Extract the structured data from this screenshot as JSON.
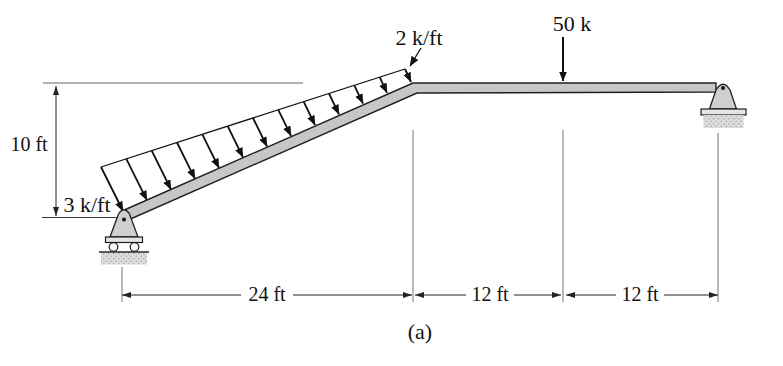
{
  "diagram": {
    "type": "structural-beam-load-diagram",
    "caption": "(a)",
    "loads": {
      "distributed": {
        "start_label": "3 k/ft",
        "end_label": "2 k/ft",
        "arrow_count": 13
      },
      "point": {
        "label": "50 k"
      }
    },
    "dimensions": {
      "height": "10 ft",
      "spans": [
        "24 ft",
        "12 ft",
        "12 ft"
      ]
    },
    "supports": {
      "left": "roller",
      "right": "pin"
    },
    "colors": {
      "beam_fill": "#c9c9c9",
      "line": "#1a1a1a",
      "ground_fill": "#dcdcdc",
      "background": "#ffffff"
    },
    "geometry": {
      "load_envelope": {
        "x1": 101,
        "y1": 167,
        "x2": 405,
        "y2": 69
      },
      "member_top": {
        "x1": 123,
        "y1": 211,
        "x2": 411,
        "y2": 82
      }
    }
  }
}
